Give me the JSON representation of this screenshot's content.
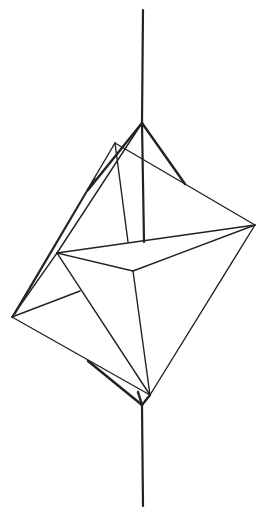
{
  "figure": {
    "stroke_color": "#222222",
    "background": "#ffffff"
  },
  "vertices": {
    "axis_top": [
      143,
      10
    ],
    "top_apex": [
      142,
      123
    ],
    "top_apex2": [
      115,
      143
    ],
    "right_arm_end": [
      185,
      184
    ],
    "right": [
      255,
      225
    ],
    "axis_center": [
      144,
      242
    ],
    "inner_top": [
      128,
      242
    ],
    "front_left": [
      57,
      253
    ],
    "center": [
      133,
      271
    ],
    "left_mid": [
      80,
      291
    ],
    "left": [
      12,
      317
    ],
    "bottom": [
      150,
      395
    ],
    "bottom_joint": [
      142,
      405
    ],
    "axis_bottom": [
      143,
      506
    ]
  }
}
